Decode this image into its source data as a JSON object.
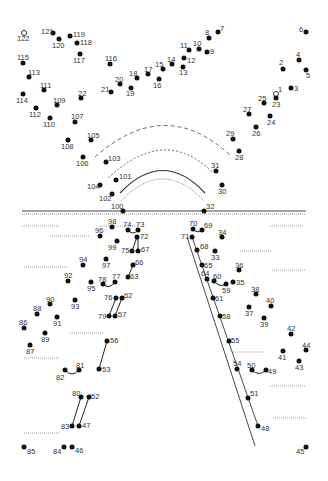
{
  "puzzle": {
    "title": "Connect the dots",
    "dots": [
      {
        "n": "1",
        "x": 276,
        "y": 94,
        "lx": 278,
        "ly": 86,
        "open": true
      },
      {
        "n": "2",
        "x": 283,
        "y": 69,
        "lx": 279,
        "ly": 59
      },
      {
        "n": "3",
        "x": 291,
        "y": 88,
        "lx": 294,
        "ly": 85
      },
      {
        "n": "4",
        "x": 299,
        "y": 60,
        "lx": 296,
        "ly": 51
      },
      {
        "n": "5",
        "x": 306,
        "y": 70,
        "lx": 306,
        "ly": 72
      },
      {
        "n": "6",
        "x": 306,
        "y": 32,
        "lx": 299,
        "ly": 26
      },
      {
        "n": "7",
        "x": 218,
        "y": 32,
        "lx": 220,
        "ly": 25
      },
      {
        "n": "8",
        "x": 209,
        "y": 38,
        "lx": 205,
        "ly": 29
      },
      {
        "n": "9",
        "x": 207,
        "y": 52,
        "lx": 210,
        "ly": 48
      },
      {
        "n": "10",
        "x": 199,
        "y": 49,
        "lx": 193,
        "ly": 40
      },
      {
        "n": "11",
        "x": 189,
        "y": 50,
        "lx": 180,
        "ly": 42
      },
      {
        "n": "12",
        "x": 184,
        "y": 58,
        "lx": 187,
        "ly": 57
      },
      {
        "n": "13",
        "x": 183,
        "y": 67,
        "lx": 179,
        "ly": 69
      },
      {
        "n": "14",
        "x": 172,
        "y": 64,
        "lx": 167,
        "ly": 56
      },
      {
        "n": "15",
        "x": 163,
        "y": 69,
        "lx": 155,
        "ly": 61
      },
      {
        "n": "16",
        "x": 159,
        "y": 79,
        "lx": 153,
        "ly": 82
      },
      {
        "n": "17",
        "x": 148,
        "y": 74,
        "lx": 144,
        "ly": 66
      },
      {
        "n": "18",
        "x": 137,
        "y": 78,
        "lx": 129,
        "ly": 70
      },
      {
        "n": "19",
        "x": 131,
        "y": 88,
        "lx": 126,
        "ly": 90
      },
      {
        "n": "20",
        "x": 120,
        "y": 84,
        "lx": 115,
        "ly": 76
      },
      {
        "n": "21",
        "x": 111,
        "y": 92,
        "lx": 101,
        "ly": 86
      },
      {
        "n": "22",
        "x": 81,
        "y": 98,
        "lx": 78,
        "ly": 90
      },
      {
        "n": "23",
        "x": 276,
        "y": 98,
        "lx": 272,
        "ly": 101
      },
      {
        "n": "24",
        "x": 270,
        "y": 116,
        "lx": 267,
        "ly": 119
      },
      {
        "n": "25",
        "x": 264,
        "y": 103,
        "lx": 258,
        "ly": 95
      },
      {
        "n": "26",
        "x": 256,
        "y": 127,
        "lx": 252,
        "ly": 130
      },
      {
        "n": "27",
        "x": 249,
        "y": 114,
        "lx": 243,
        "ly": 106
      },
      {
        "n": "28",
        "x": 239,
        "y": 151,
        "lx": 235,
        "ly": 154
      },
      {
        "n": "29",
        "x": 233,
        "y": 139,
        "lx": 226,
        "ly": 130
      },
      {
        "n": "30",
        "x": 222,
        "y": 185,
        "lx": 218,
        "ly": 188
      },
      {
        "n": "31",
        "x": 216,
        "y": 171,
        "lx": 211,
        "ly": 162
      },
      {
        "n": "32",
        "x": 204,
        "y": 211,
        "lx": 206,
        "ly": 203
      },
      {
        "n": "33",
        "x": 215,
        "y": 251,
        "lx": 211,
        "ly": 254
      },
      {
        "n": "34",
        "x": 222,
        "y": 237,
        "lx": 218,
        "ly": 229
      },
      {
        "n": "35",
        "x": 233,
        "y": 282,
        "lx": 236,
        "ly": 279
      },
      {
        "n": "36",
        "x": 239,
        "y": 270,
        "lx": 235,
        "ly": 262
      },
      {
        "n": "37",
        "x": 249,
        "y": 307,
        "lx": 245,
        "ly": 310
      },
      {
        "n": "38",
        "x": 256,
        "y": 294,
        "lx": 251,
        "ly": 286
      },
      {
        "n": "39",
        "x": 264,
        "y": 318,
        "lx": 260,
        "ly": 321
      },
      {
        "n": "40",
        "x": 271,
        "y": 306,
        "lx": 266,
        "ly": 297
      },
      {
        "n": "41",
        "x": 283,
        "y": 351,
        "lx": 278,
        "ly": 354
      },
      {
        "n": "42",
        "x": 291,
        "y": 334,
        "lx": 287,
        "ly": 325
      },
      {
        "n": "43",
        "x": 299,
        "y": 361,
        "lx": 295,
        "ly": 364
      },
      {
        "n": "44",
        "x": 306,
        "y": 350,
        "lx": 302,
        "ly": 342
      },
      {
        "n": "45",
        "x": 306,
        "y": 447,
        "lx": 296,
        "ly": 448
      },
      {
        "n": "46",
        "x": 72,
        "y": 447,
        "lx": 75,
        "ly": 447
      },
      {
        "n": "47",
        "x": 79,
        "y": 426,
        "lx": 82,
        "ly": 422
      },
      {
        "n": "48",
        "x": 258,
        "y": 426,
        "lx": 261,
        "ly": 425
      },
      {
        "n": "49",
        "x": 266,
        "y": 370,
        "lx": 268,
        "ly": 368
      },
      {
        "n": "50",
        "x": 252,
        "y": 370,
        "lx": 247,
        "ly": 362
      },
      {
        "n": "51",
        "x": 248,
        "y": 398,
        "lx": 250,
        "ly": 390
      },
      {
        "n": "52",
        "x": 89,
        "y": 397,
        "lx": 91,
        "ly": 393
      },
      {
        "n": "53",
        "x": 99,
        "y": 369,
        "lx": 102,
        "ly": 366
      },
      {
        "n": "54",
        "x": 237,
        "y": 369,
        "lx": 233,
        "ly": 360
      },
      {
        "n": "55",
        "x": 229,
        "y": 341,
        "lx": 231,
        "ly": 337
      },
      {
        "n": "56",
        "x": 107,
        "y": 341,
        "lx": 110,
        "ly": 337
      },
      {
        "n": "57",
        "x": 115,
        "y": 316,
        "lx": 118,
        "ly": 311
      },
      {
        "n": "58",
        "x": 220,
        "y": 316,
        "lx": 222,
        "ly": 313
      },
      {
        "n": "59",
        "x": 226,
        "y": 284,
        "lx": 222,
        "ly": 287
      },
      {
        "n": "60",
        "x": 214,
        "y": 281,
        "lx": 213,
        "ly": 273
      },
      {
        "n": "61",
        "x": 213,
        "y": 298,
        "lx": 215,
        "ly": 295
      },
      {
        "n": "62",
        "x": 122,
        "y": 298,
        "lx": 124,
        "ly": 292
      },
      {
        "n": "63",
        "x": 128,
        "y": 277,
        "lx": 130,
        "ly": 273
      },
      {
        "n": "64",
        "x": 207,
        "y": 279,
        "lx": 201,
        "ly": 270
      },
      {
        "n": "65",
        "x": 202,
        "y": 265,
        "lx": 204,
        "ly": 262
      },
      {
        "n": "66",
        "x": 133,
        "y": 265,
        "lx": 135,
        "ly": 259
      },
      {
        "n": "67",
        "x": 138,
        "y": 251,
        "lx": 141,
        "ly": 246
      },
      {
        "n": "68",
        "x": 197,
        "y": 250,
        "lx": 200,
        "ly": 243
      },
      {
        "n": "69",
        "x": 202,
        "y": 230,
        "lx": 204,
        "ly": 222
      },
      {
        "n": "70",
        "x": 193,
        "y": 229,
        "lx": 189,
        "ly": 220
      },
      {
        "n": "71",
        "x": 192,
        "y": 237,
        "lx": 181,
        "ly": 233
      },
      {
        "n": "72",
        "x": 137,
        "y": 237,
        "lx": 140,
        "ly": 233
      },
      {
        "n": "73",
        "x": 138,
        "y": 230,
        "lx": 136,
        "ly": 221
      },
      {
        "n": "74",
        "x": 128,
        "y": 230,
        "lx": 123,
        "ly": 221
      },
      {
        "n": "75",
        "x": 132,
        "y": 251,
        "lx": 121,
        "ly": 247
      },
      {
        "n": "76",
        "x": 116,
        "y": 298,
        "lx": 104,
        "ly": 294
      },
      {
        "n": "77",
        "x": 115,
        "y": 282,
        "lx": 112,
        "ly": 273
      },
      {
        "n": "78",
        "x": 103,
        "y": 284,
        "lx": 98,
        "ly": 276
      },
      {
        "n": "79",
        "x": 109,
        "y": 316,
        "lx": 98,
        "ly": 313
      },
      {
        "n": "80",
        "x": 81,
        "y": 397,
        "lx": 72,
        "ly": 390
      },
      {
        "n": "81",
        "x": 79,
        "y": 370,
        "lx": 76,
        "ly": 362
      },
      {
        "n": "82",
        "x": 65,
        "y": 370,
        "lx": 56,
        "ly": 374
      },
      {
        "n": "83",
        "x": 72,
        "y": 426,
        "lx": 61,
        "ly": 423
      },
      {
        "n": "84",
        "x": 64,
        "y": 447,
        "lx": 53,
        "ly": 448
      },
      {
        "n": "85",
        "x": 24,
        "y": 447,
        "lx": 27,
        "ly": 448
      },
      {
        "n": "86",
        "x": 24,
        "y": 328,
        "lx": 19,
        "ly": 319
      },
      {
        "n": "87",
        "x": 30,
        "y": 345,
        "lx": 26,
        "ly": 348
      },
      {
        "n": "88",
        "x": 37,
        "y": 314,
        "lx": 33,
        "ly": 305
      },
      {
        "n": "89",
        "x": 45,
        "y": 333,
        "lx": 41,
        "ly": 336
      },
      {
        "n": "90",
        "x": 50,
        "y": 304,
        "lx": 46,
        "ly": 296
      },
      {
        "n": "91",
        "x": 57,
        "y": 317,
        "lx": 53,
        "ly": 320
      },
      {
        "n": "92",
        "x": 68,
        "y": 281,
        "lx": 64,
        "ly": 272
      },
      {
        "n": "93",
        "x": 75,
        "y": 300,
        "lx": 71,
        "ly": 303
      },
      {
        "n": "94",
        "x": 83,
        "y": 265,
        "lx": 79,
        "ly": 256
      },
      {
        "n": "95",
        "x": 91,
        "y": 282,
        "lx": 87,
        "ly": 285
      },
      {
        "n": "96",
        "x": 100,
        "y": 236,
        "lx": 95,
        "ly": 227
      },
      {
        "n": "97",
        "x": 106,
        "y": 259,
        "lx": 102,
        "ly": 262
      },
      {
        "n": "98",
        "x": 112,
        "y": 227,
        "lx": 108,
        "ly": 218
      },
      {
        "n": "99",
        "x": 117,
        "y": 241,
        "lx": 108,
        "ly": 244
      },
      {
        "n": "100",
        "x": 123,
        "y": 211,
        "lx": 111,
        "ly": 203
      },
      {
        "n": "101",
        "x": 116,
        "y": 180,
        "lx": 119,
        "ly": 173
      },
      {
        "n": "102",
        "x": 112,
        "y": 194,
        "lx": 99,
        "ly": 195
      },
      {
        "n": "103",
        "x": 106,
        "y": 162,
        "lx": 108,
        "ly": 155
      },
      {
        "n": "104",
        "x": 100,
        "y": 185,
        "lx": 87,
        "ly": 183
      },
      {
        "n": "105",
        "x": 91,
        "y": 140,
        "lx": 87,
        "ly": 132
      },
      {
        "n": "106",
        "x": 83,
        "y": 157,
        "lx": 76,
        "ly": 160
      },
      {
        "n": "107",
        "x": 75,
        "y": 122,
        "lx": 71,
        "ly": 113
      },
      {
        "n": "108",
        "x": 68,
        "y": 140,
        "lx": 61,
        "ly": 143
      },
      {
        "n": "109",
        "x": 57,
        "y": 105,
        "lx": 53,
        "ly": 97
      },
      {
        "n": "110",
        "x": 50,
        "y": 118,
        "lx": 43,
        "ly": 121
      },
      {
        "n": "111",
        "x": 44,
        "y": 90,
        "lx": 40,
        "ly": 82
      },
      {
        "n": "112",
        "x": 36,
        "y": 108,
        "lx": 29,
        "ly": 111
      },
      {
        "n": "113",
        "x": 29,
        "y": 77,
        "lx": 28,
        "ly": 69
      },
      {
        "n": "114",
        "x": 23,
        "y": 94,
        "lx": 16,
        "ly": 97
      },
      {
        "n": "115",
        "x": 23,
        "y": 63,
        "lx": 17,
        "ly": 54
      },
      {
        "n": "116",
        "x": 110,
        "y": 64,
        "lx": 105,
        "ly": 55
      },
      {
        "n": "117",
        "x": 80,
        "y": 54,
        "lx": 73,
        "ly": 57
      },
      {
        "n": "118",
        "x": 77,
        "y": 43,
        "lx": 80,
        "ly": 39
      },
      {
        "n": "119",
        "x": 70,
        "y": 36,
        "lx": 73,
        "ly": 31
      },
      {
        "n": "120",
        "x": 59,
        "y": 39,
        "lx": 52,
        "ly": 42
      },
      {
        "n": "121",
        "x": 53,
        "y": 33,
        "lx": 41,
        "ly": 28
      },
      {
        "n": "122",
        "x": 24,
        "y": 33,
        "lx": 17,
        "ly": 35,
        "open": true
      }
    ]
  }
}
